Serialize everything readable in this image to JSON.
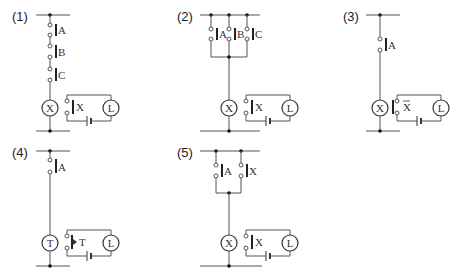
{
  "diagram": {
    "type": "relay-ladder-circuits",
    "panels": [
      {
        "label": "(1)",
        "description": "Series AND circuit",
        "switches": [
          "A",
          "B",
          "C"
        ],
        "coil": "X",
        "output_contact": "X",
        "lamp": "L"
      },
      {
        "label": "(2)",
        "description": "Parallel OR circuit",
        "switches": [
          "A",
          "B",
          "C"
        ],
        "coil": "X",
        "output_contact": "X",
        "lamp": "L"
      },
      {
        "label": "(3)",
        "description": "NOT circuit with normally-closed contact",
        "switches": [
          "A"
        ],
        "coil": "X",
        "output_contact": "X",
        "output_contact_type": "normally-closed",
        "lamp": "L"
      },
      {
        "label": "(4)",
        "description": "Timer circuit",
        "switches": [
          "A"
        ],
        "coil": "T",
        "output_contact": "T",
        "output_contact_type": "timer",
        "lamp": "L"
      },
      {
        "label": "(5)",
        "description": "Self-holding circuit",
        "switches": [
          "A",
          "X"
        ],
        "coil": "X",
        "output_contact": "X",
        "lamp": "L"
      }
    ]
  }
}
